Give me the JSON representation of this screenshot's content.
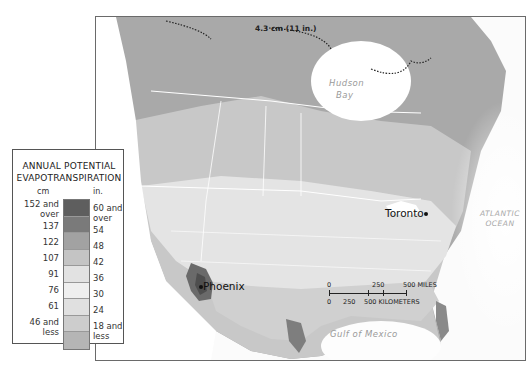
{
  "map": {
    "title": "ANNUAL POTENTIAL EVAPOTRANSPIRATION",
    "cities": [
      {
        "name": "Toronto",
        "x": 440,
        "y": 212
      },
      {
        "name": "Phoenix",
        "x": 201,
        "y": 285
      }
    ],
    "water_labels": {
      "hudson": "Hudson",
      "bay": "Bay",
      "atlantic": "ATLANTIC",
      "ocean": "OCEAN",
      "gulf": "Gulf of Mexico",
      "tropic": "Tropic of Cancer"
    },
    "isoline_annotation": "4.3 cm (11 in.)",
    "graticule_ticks": [
      "140",
      "120",
      "130",
      "110",
      "80",
      "90",
      "40",
      "50",
      "70",
      "60"
    ]
  },
  "legend": {
    "title_line1": "ANNUAL POTENTIAL",
    "title_line2": "EVAPOTRANSPIRATION",
    "unit_cm": "cm",
    "unit_in": "in.",
    "classes": [
      {
        "cm": "152 and over",
        "in": "60 and over",
        "color": "#5e5e5e"
      },
      {
        "cm": "137",
        "in": "54",
        "color": "#7a7a7a"
      },
      {
        "cm": "122",
        "in": "48",
        "color": "#a2a2a2"
      },
      {
        "cm": "107",
        "in": "42",
        "color": "#c4c4c4"
      },
      {
        "cm": "91",
        "in": "36",
        "color": "#e2e2e2"
      },
      {
        "cm": "76",
        "in": "30",
        "color": "#efefef"
      },
      {
        "cm": "61",
        "in": "24",
        "color": "#e0e0e0"
      },
      {
        "cm": "",
        "in": "",
        "color": "#cdcdcd"
      },
      {
        "cm": "46 and less",
        "in": "18 and less",
        "color": "#b5b5b5"
      }
    ],
    "labels_cm": [
      "152 and",
      "over",
      "137",
      "122",
      "107",
      "91",
      "76",
      "61",
      "46 and",
      "less"
    ],
    "labels_in": [
      "60 and",
      "over",
      "54",
      "48",
      "42",
      "36",
      "30",
      "24",
      "18 and",
      "less"
    ]
  },
  "scale_bar": {
    "miles_labels": [
      "0",
      "250",
      "500 MILES"
    ],
    "km_labels": [
      "0",
      "250",
      "500 KILOMETERS"
    ]
  }
}
